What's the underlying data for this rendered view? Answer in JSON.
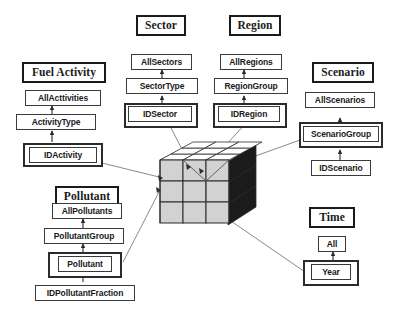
{
  "diagram": {
    "center_object": "3d-data-cube",
    "cube": {
      "rows": 3,
      "cols": 3,
      "depth": 3
    },
    "colors": {
      "box_border": "#3a3a3a",
      "title_border": "#1a1a1a",
      "text": "#1a1a1a",
      "connector": "#8a8a8a",
      "arrow": "#2b2b2b",
      "cube_face_front": "#d2d2d2",
      "cube_face_top": "#ffffff",
      "cube_face_side": "#1b1b1b",
      "background": "#ffffff"
    },
    "dimensions": [
      {
        "id": "fuel-activity",
        "title": "Fuel Activity",
        "levels": [
          "AllActtivities",
          "ActivityType",
          "IDActivity"
        ],
        "leaf": "IDActivity",
        "leaf_double_border": true,
        "connects_to_cube": true
      },
      {
        "id": "sector",
        "title": "Sector",
        "levels": [
          "AllSectors",
          "SectorType",
          "IDSector"
        ],
        "leaf": "IDSector",
        "leaf_double_border": true,
        "connects_to_cube": true
      },
      {
        "id": "region",
        "title": "Region",
        "levels": [
          "AllRegions",
          "RegionGroup",
          "IDRegion"
        ],
        "leaf": "IDRegion",
        "leaf_double_border": true,
        "connects_to_cube": true
      },
      {
        "id": "scenario",
        "title": "Scenario",
        "levels": [
          "AllScenarios",
          "ScenarioGroup",
          "IDScenario"
        ],
        "leaf": "ScenarioGroup",
        "leaf_double_border": true,
        "connects_to_cube": true
      },
      {
        "id": "pollutant",
        "title": "Pollutant",
        "levels": [
          "AllPollutants",
          "PollutantGroup",
          "Pollutant",
          "IDPollutantFraction"
        ],
        "leaf": "Pollutant",
        "leaf_double_border": true,
        "connects_to_cube": true
      },
      {
        "id": "time",
        "title": "Time",
        "levels": [
          "All",
          "Year"
        ],
        "leaf": "Year",
        "leaf_double_border": true,
        "connects_to_cube": true
      }
    ],
    "labels": {
      "fuel_activity_title": "Fuel Activity",
      "fuel_activity_l1": "AllActtivities",
      "fuel_activity_l2": "ActivityType",
      "fuel_activity_l3": "IDActivity",
      "sector_title": "Sector",
      "sector_l1": "AllSectors",
      "sector_l2": "SectorType",
      "sector_l3": "IDSector",
      "region_title": "Region",
      "region_l1": "AllRegions",
      "region_l2": "RegionGroup",
      "region_l3": "IDRegion",
      "scenario_title": "Scenario",
      "scenario_l1": "AllScenarios",
      "scenario_l2": "ScenarioGroup",
      "scenario_l3": "IDScenario",
      "pollutant_title": "Pollutant",
      "pollutant_l1": "AllPollutants",
      "pollutant_l2": "PollutantGroup",
      "pollutant_l3": "Pollutant",
      "pollutant_l4": "IDPollutantFraction",
      "time_title": "Time",
      "time_l1": "All",
      "time_l2": "Year"
    }
  }
}
